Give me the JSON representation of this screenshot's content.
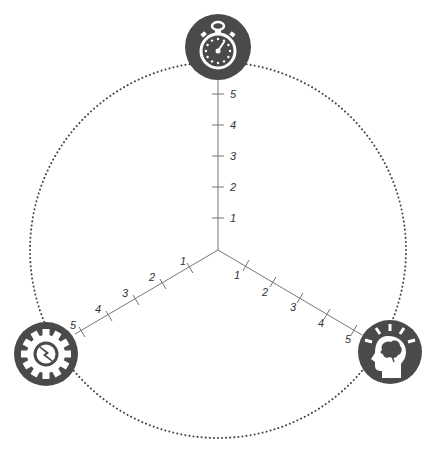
{
  "diagram": {
    "type": "three-axis-radar",
    "center": [
      218,
      250
    ],
    "circle": {
      "radius": 188,
      "style": "dotted",
      "color": "#444444"
    },
    "axis_color": "#777777",
    "icon_color": "#4a4a4a",
    "axes": [
      {
        "name": "time",
        "icon": "stopwatch-icon",
        "direction": "up",
        "ticks": [
          "1",
          "2",
          "3",
          "4",
          "5"
        ]
      },
      {
        "name": "knowledge",
        "icon": "head-brain-lightbulb-icon",
        "direction": "lower-right",
        "ticks": [
          "1",
          "2",
          "3",
          "4",
          "5"
        ]
      },
      {
        "name": "tools",
        "icon": "gear-wrench-icon",
        "direction": "lower-left",
        "ticks": [
          "1",
          "2",
          "3",
          "4",
          "5"
        ]
      }
    ]
  }
}
